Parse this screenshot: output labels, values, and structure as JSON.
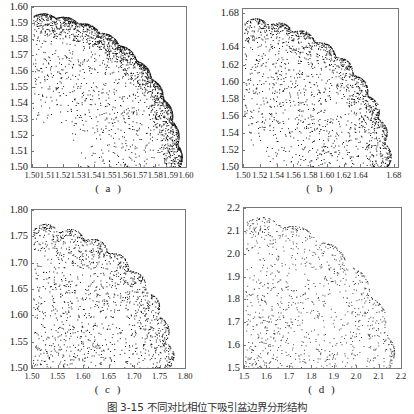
{
  "figure": {
    "caption": "图 3-15  不同对比相位下吸引盆边界分形结构"
  },
  "chart_data": [
    {
      "type": "scatter",
      "label": "( a )",
      "frame": {
        "x": 31,
        "y": 6,
        "w": 156,
        "h": 162
      },
      "xlim": [
        1.5,
        1.6
      ],
      "ylim": [
        1.5,
        1.6
      ],
      "xticks": [
        "1.50",
        "1.51",
        "1.52",
        "1.53",
        "1.54",
        "1.55",
        "1.56",
        "1.57",
        "1.58",
        "1.59",
        "1.60"
      ],
      "yticks": [
        "1.60",
        "1.59",
        "1.58",
        "1.57",
        "1.56",
        "1.55",
        "1.54",
        "1.53",
        "1.52",
        "1.51",
        "1.50"
      ],
      "grid": false,
      "description": "Dense point cloud bounded by a dark circular arc (radius ≈0.095 from origin 1.50,1.50) with scattered points inside",
      "boundary": {
        "cx": 1.5,
        "cy": 1.5,
        "r": 0.095,
        "scallops": 10,
        "scallop_amp": 0.002
      },
      "density": {
        "n": 2600,
        "band": 0.035,
        "edge_weight": 0.7
      },
      "seed": 11
    },
    {
      "type": "scatter",
      "label": "( b )",
      "frame": {
        "x": 242,
        "y": 8,
        "w": 157,
        "h": 160
      },
      "xlim": [
        1.5,
        1.685
      ],
      "ylim": [
        1.5,
        1.685
      ],
      "xticks": [
        "1.50",
        "1.52",
        "1.54",
        "1.56",
        "1.58",
        "1.60",
        "1.62",
        "1.64",
        "1.68"
      ],
      "yticks": [
        "1.68",
        "1.64",
        "1.62",
        "1.60",
        "1.58",
        "1.56",
        "1.54",
        "1.52",
        "1.50"
      ],
      "grid": false,
      "description": "Scalloped circular boundary (radius ≈0.17) with dense edge and sparser interior points",
      "boundary": {
        "cx": 1.5,
        "cy": 1.5,
        "r": 0.17,
        "scallops": 9,
        "scallop_amp": 0.006
      },
      "density": {
        "n": 1900,
        "band": 0.075,
        "edge_weight": 0.55
      },
      "seed": 23
    },
    {
      "type": "scatter",
      "label": "( c )",
      "frame": {
        "x": 31,
        "y": 209,
        "w": 155,
        "h": 160
      },
      "xlim": [
        1.5,
        1.8
      ],
      "ylim": [
        1.5,
        1.8
      ],
      "xticks": [
        "1.50",
        "1.55",
        "1.60",
        "1.65",
        "1.70",
        "1.75",
        "1.80"
      ],
      "yticks": [
        "1.80",
        "1.75",
        "1.70",
        "1.65",
        "1.60",
        "1.55",
        "1.50"
      ],
      "grid": false,
      "description": "Larger scalloped arc boundary (radius ≈0.265) with lighter interior scatter",
      "boundary": {
        "cx": 1.5,
        "cy": 1.5,
        "r": 0.265,
        "scallops": 8,
        "scallop_amp": 0.012
      },
      "density": {
        "n": 1500,
        "band": 0.14,
        "edge_weight": 0.45
      },
      "seed": 37
    },
    {
      "type": "scatter",
      "label": "( d )",
      "frame": {
        "x": 243,
        "y": 207,
        "w": 159,
        "h": 162
      },
      "xlim": [
        1.5,
        2.2
      ],
      "ylim": [
        1.5,
        2.2
      ],
      "xticks": [
        "1.5",
        "1.6",
        "1.7",
        "1.8",
        "1.9",
        "2.0",
        "2.1",
        "2.2"
      ],
      "yticks": [
        "2.2",
        "2.1",
        "2.0",
        "1.9",
        "1.8",
        "1.7",
        "1.6",
        "1.5"
      ],
      "grid": false,
      "description": "Sparse, fragmented points along an arc of radius ≈0.64 with clusters near (1.98,1.90) and (2.14,1.70)",
      "boundary": {
        "cx": 1.5,
        "cy": 1.5,
        "r": 0.64,
        "scallops": 6,
        "scallop_amp": 0.03
      },
      "density": {
        "n": 1100,
        "band": 0.38,
        "edge_weight": 0.35
      },
      "seed": 53
    }
  ]
}
